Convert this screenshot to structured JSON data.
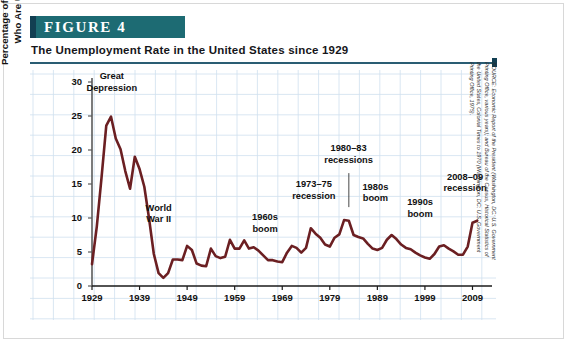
{
  "header": {
    "banner_label": "FIGURE  4",
    "title": "The Unemployment Rate in the United States since 1929"
  },
  "source": {
    "line1": "SOURCE: Economic Report of the President (Washington, DC: U.S. Government",
    "line2": "Printing Office, various years); and Bureau of the Census, Historical Statistics of",
    "line3": "the United States, Colonial Times to 1970 (Washington, DC: U.S. Government",
    "line4": "Printing Office, 1975)."
  },
  "colors": {
    "banner": "#1d6b73",
    "banner_cap": "#123f52",
    "rule": "#2a5d73",
    "grid_minor": "#cfe0ef",
    "grid_major": "#a9c6dd",
    "axis": "#5a5a5a",
    "line": "#6b1f22"
  },
  "chart_data": {
    "type": "line",
    "title": "The Unemployment Rate in the United States since 1929",
    "xlabel": "",
    "ylabel": "Percentage of Civilian Workers Who Are Unemployed",
    "ylabel_line1": "Percentage of Civilian Workers",
    "ylabel_line2": "Who Are Unemployed",
    "xlim": [
      1929,
      2011
    ],
    "ylim": [
      0,
      30
    ],
    "yticks": [
      0,
      5,
      10,
      15,
      20,
      25,
      30
    ],
    "xticks": [
      1929,
      1939,
      1949,
      1959,
      1969,
      1979,
      1989,
      1999,
      2009
    ],
    "grid": true,
    "legend": "none",
    "series": [
      {
        "name": "Unemployment rate",
        "x": [
          1929,
          1930,
          1931,
          1932,
          1933,
          1934,
          1935,
          1936,
          1937,
          1938,
          1939,
          1940,
          1941,
          1942,
          1943,
          1944,
          1945,
          1946,
          1947,
          1948,
          1949,
          1950,
          1951,
          1952,
          1953,
          1954,
          1955,
          1956,
          1957,
          1958,
          1959,
          1960,
          1961,
          1962,
          1963,
          1964,
          1965,
          1966,
          1967,
          1968,
          1969,
          1970,
          1971,
          1972,
          1973,
          1974,
          1975,
          1976,
          1977,
          1978,
          1979,
          1980,
          1981,
          1982,
          1983,
          1984,
          1985,
          1986,
          1987,
          1988,
          1989,
          1990,
          1991,
          1992,
          1993,
          1994,
          1995,
          1996,
          1997,
          1998,
          1999,
          2000,
          2001,
          2002,
          2003,
          2004,
          2005,
          2006,
          2007,
          2008,
          2009,
          2010
        ],
        "values": [
          3.2,
          8.7,
          15.9,
          23.6,
          24.9,
          21.7,
          20.1,
          16.9,
          14.3,
          19.0,
          17.2,
          14.6,
          9.9,
          4.7,
          1.9,
          1.2,
          1.9,
          3.9,
          3.9,
          3.8,
          5.9,
          5.3,
          3.3,
          3.0,
          2.9,
          5.5,
          4.4,
          4.1,
          4.3,
          6.8,
          5.5,
          5.5,
          6.7,
          5.5,
          5.7,
          5.2,
          4.5,
          3.8,
          3.8,
          3.6,
          3.5,
          4.9,
          5.9,
          5.6,
          4.9,
          5.6,
          8.5,
          7.7,
          7.1,
          6.1,
          5.8,
          7.1,
          7.6,
          9.7,
          9.6,
          7.5,
          7.2,
          7.0,
          6.2,
          5.5,
          5.3,
          5.6,
          6.8,
          7.5,
          6.9,
          6.1,
          5.6,
          5.4,
          4.9,
          4.5,
          4.2,
          4.0,
          4.7,
          5.8,
          6.0,
          5.5,
          5.1,
          4.6,
          4.6,
          5.8,
          9.3,
          9.6
        ]
      }
    ],
    "annotations": [
      {
        "id": "great-depression",
        "line1": "Great",
        "line2": "Depression"
      },
      {
        "id": "world-war-ii",
        "line1": "World",
        "line2": "War II"
      },
      {
        "id": "1960s-boom",
        "line1": "1960s",
        "line2": "boom"
      },
      {
        "id": "1973-75-recession",
        "line1": "1973–75",
        "line2": "recession"
      },
      {
        "id": "1980-83-recessions",
        "line1": "1980–83",
        "line2": "recessions"
      },
      {
        "id": "1980s-boom",
        "line1": "1980s",
        "line2": "boom"
      },
      {
        "id": "1990s-boom",
        "line1": "1990s",
        "line2": "boom"
      },
      {
        "id": "2008-09-recession",
        "line1": "2008–09",
        "line2": "recession"
      }
    ]
  }
}
